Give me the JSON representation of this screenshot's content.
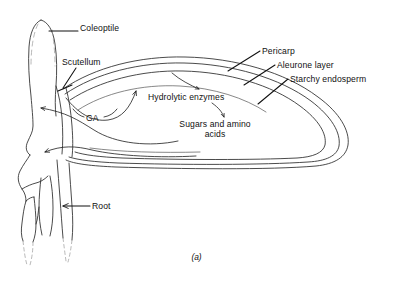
{
  "figure": {
    "caption": "(a)",
    "background_color": "#ffffff",
    "line_color": "#1a1a1a"
  },
  "labels": {
    "coleoptile": "Coleoptile",
    "scutellum": "Scutellum",
    "ga": "GA",
    "hydrolytic_enzymes": "Hydrolytic enzymes",
    "sugars_and_amino_acids": "Sugars and amino acids",
    "pericarp": "Pericarp",
    "aleurone_layer": "Aleurone layer",
    "starchy_endosperm": "Starchy endosperm",
    "root": "Root"
  },
  "structures": [
    {
      "name": "coleoptile",
      "label": "Coleoptile",
      "leader": "horizontal-line",
      "side": "left"
    },
    {
      "name": "scutellum",
      "label": "Scutellum",
      "leader": "diagonal-line",
      "side": "left"
    },
    {
      "name": "root",
      "label": "Root",
      "leader": "arrow-left",
      "side": "left"
    },
    {
      "name": "pericarp",
      "label": "Pericarp",
      "leader": "diagonal-line",
      "side": "right"
    },
    {
      "name": "aleurone-layer",
      "label": "Aleurone layer",
      "leader": "diagonal-line",
      "side": "right"
    },
    {
      "name": "starchy-endosperm",
      "label": "Starchy endosperm",
      "leader": "diagonal-line",
      "side": "right"
    }
  ],
  "flows": [
    {
      "name": "ga-to-aleurone",
      "label": "GA",
      "from": "scutellum",
      "to": "aleurone layer",
      "arrow": "up-right"
    },
    {
      "name": "aleurone-to-enzymes",
      "label": "Hydrolytic enzymes",
      "from": "aleurone layer",
      "to": "starchy endosperm",
      "arrow": "down"
    },
    {
      "name": "enzymes-to-sugars",
      "label": "Sugars and amino acids",
      "from": "hydrolytic enzymes",
      "to": "sugars and amino acids",
      "arrow": "down"
    },
    {
      "name": "sugars-to-embryo-upper",
      "label": "",
      "from": "endosperm",
      "to": "embryo",
      "arrow": "up-left"
    },
    {
      "name": "sugars-to-embryo-lower",
      "label": "",
      "from": "endosperm",
      "to": "embryo",
      "arrow": "down-left"
    }
  ]
}
